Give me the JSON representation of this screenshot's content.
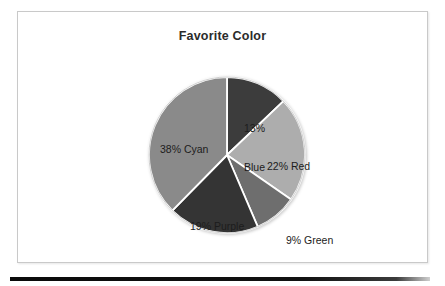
{
  "panel": {
    "title": "Favorite Color"
  },
  "chart_data": {
    "type": "pie",
    "title": "Favorite Color",
    "xlabel": "",
    "ylabel": "",
    "legend": "none",
    "grid": false,
    "start_angle_deg": 0,
    "direction": "clockwise",
    "categories": [
      "Blue",
      "Red",
      "Green",
      "Purple",
      "Cyan"
    ],
    "values": [
      13,
      22,
      9,
      19,
      38
    ],
    "value_unit": "%",
    "slices": [
      {
        "name": "Blue",
        "value": 13,
        "label": "13%\nBlue",
        "label_line1": "13%",
        "label_line2": "Blue",
        "label_position": "inside",
        "color": "#3c3c3c"
      },
      {
        "name": "Red",
        "value": 22,
        "label": "22% Red",
        "label_position": "inside",
        "color": "#adadad"
      },
      {
        "name": "Green",
        "value": 9,
        "label": "9% Green",
        "label_position": "outside",
        "color": "#6e6e6e"
      },
      {
        "name": "Purple",
        "value": 19,
        "label": "19% Purple",
        "label_position": "inside",
        "color": "#343434"
      },
      {
        "name": "Cyan",
        "value": 38,
        "label": "38% Cyan",
        "label_position": "inside",
        "color": "#8a8a8a"
      }
    ],
    "separator_color": "#ffffff"
  }
}
